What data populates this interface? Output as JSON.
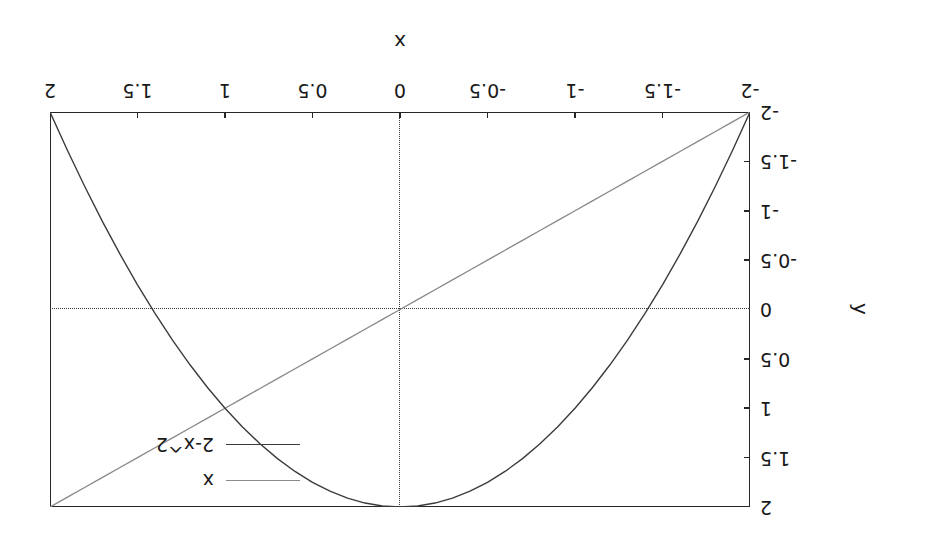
{
  "chart_data": {
    "type": "line",
    "title": "",
    "xlabel": "x",
    "ylabel": "y",
    "xlim": [
      -2,
      2
    ],
    "ylim": [
      -2,
      2
    ],
    "grid": false,
    "zero_lines_dotted": true,
    "legend_position": "upper right",
    "orientation_note": "figure rendered rotated 180 degrees",
    "xticks": [
      -2,
      -1.5,
      -1,
      -0.5,
      0,
      0.5,
      1,
      1.5,
      2
    ],
    "xticklabels": [
      "-2",
      "-1.5",
      "-1",
      "-0.5",
      "0",
      "0.5",
      "1",
      "1.5",
      "2"
    ],
    "yticks": [
      -2,
      -1.5,
      -1,
      -0.5,
      0,
      0.5,
      1,
      1.5,
      2
    ],
    "yticklabels": [
      "-2",
      "-1.5",
      "-1",
      "-0.5",
      "0",
      "0.5",
      "1",
      "1.5",
      "2"
    ],
    "x": [
      -2,
      -1.9,
      -1.8,
      -1.7,
      -1.6,
      -1.5,
      -1.4,
      -1.3,
      -1.2,
      -1.1,
      -1,
      -0.9,
      -0.8,
      -0.7,
      -0.6,
      -0.5,
      -0.4,
      -0.3,
      -0.2,
      -0.1,
      0,
      0.1,
      0.2,
      0.3,
      0.4,
      0.5,
      0.6,
      0.7,
      0.8,
      0.9,
      1,
      1.1,
      1.2,
      1.3,
      1.4,
      1.5,
      1.6,
      1.7,
      1.8,
      1.9,
      2
    ],
    "series": [
      {
        "name": "x",
        "color": "#8a8a8a",
        "linewidth": 1.4,
        "values": [
          -2,
          -1.9,
          -1.8,
          -1.7,
          -1.6,
          -1.5,
          -1.4,
          -1.3,
          -1.2,
          -1.1,
          -1,
          -0.9,
          -0.8,
          -0.7,
          -0.6,
          -0.5,
          -0.4,
          -0.3,
          -0.2,
          -0.1,
          0,
          0.1,
          0.2,
          0.3,
          0.4,
          0.5,
          0.6,
          0.7,
          0.8,
          0.9,
          1,
          1.1,
          1.2,
          1.3,
          1.4,
          1.5,
          1.6,
          1.7,
          1.8,
          1.9,
          2
        ]
      },
      {
        "name": "2-x^2",
        "color": "#3c3c3c",
        "linewidth": 1.4,
        "values": [
          -2,
          -1.61,
          -1.24,
          -0.89,
          -0.56,
          -0.25,
          0.04,
          0.31,
          0.56,
          0.79,
          1,
          1.19,
          1.36,
          1.51,
          1.64,
          1.75,
          1.84,
          1.91,
          1.96,
          1.99,
          2,
          1.99,
          1.96,
          1.91,
          1.84,
          1.75,
          1.64,
          1.51,
          1.36,
          1.19,
          1,
          0.79,
          0.56,
          0.31,
          0.04,
          -0.25,
          -0.56,
          -0.89,
          -1.24,
          -1.61,
          -2
        ]
      }
    ]
  },
  "legend": {
    "entries": [
      {
        "label": "x"
      },
      {
        "label": "2-x^2"
      }
    ]
  },
  "axes": {
    "xlabel": "x",
    "ylabel": "y"
  },
  "colors": {
    "frame": "#262626",
    "text": "#1a1a1a",
    "series_x": "#8a8a8a",
    "series_parabola": "#3c3c3c",
    "zero_line": "#3a3a3a",
    "background": "#ffffff"
  }
}
